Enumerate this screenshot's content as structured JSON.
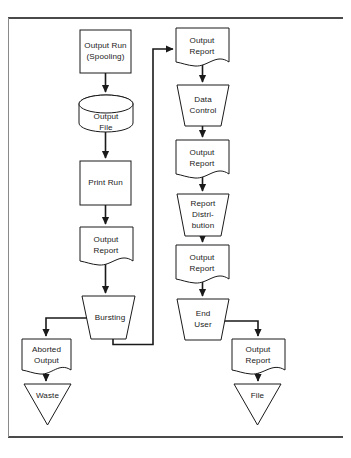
{
  "diagram": {
    "type": "flowchart",
    "colors": {
      "stroke": "#1a1a1a",
      "fill": "#ffffff",
      "frame": "#4a4a4a",
      "background": "#ffffff"
    },
    "nodes": [
      {
        "id": "output-run",
        "label_line1": "Output Run",
        "label_line2": "(Spooling)",
        "shape": "process",
        "x": 80,
        "y": 30,
        "w": 51,
        "h": 43
      },
      {
        "id": "output-file",
        "label_line1": "Output",
        "label_line2": "File",
        "shape": "cylinder",
        "x": 79,
        "y": 95,
        "w": 54,
        "h": 37
      },
      {
        "id": "print-run",
        "label_line1": "Print Run",
        "label_line2": "",
        "shape": "process",
        "x": 80,
        "y": 161,
        "w": 51,
        "h": 44
      },
      {
        "id": "output-report-1",
        "label_line1": "Output",
        "label_line2": "Report",
        "shape": "document",
        "x": 80,
        "y": 227,
        "w": 53,
        "h": 42
      },
      {
        "id": "bursting",
        "label_line1": "Bursting",
        "label_line2": "",
        "shape": "manual",
        "x": 82,
        "y": 296,
        "w": 53,
        "h": 43
      },
      {
        "id": "aborted-output",
        "label_line1": "Aborted",
        "label_line2": "Output",
        "shape": "document",
        "x": 22,
        "y": 339,
        "w": 49,
        "h": 39
      },
      {
        "id": "waste",
        "label_line1": "Waste",
        "label_line2": "",
        "shape": "triangle",
        "x": 24,
        "y": 384,
        "w": 47,
        "h": 41
      },
      {
        "id": "output-report-top",
        "label_line1": "Output",
        "label_line2": "Report",
        "shape": "document",
        "x": 176,
        "y": 28,
        "w": 53,
        "h": 42
      },
      {
        "id": "data-control",
        "label_line1": "Data",
        "label_line2": "Control",
        "shape": "manual",
        "x": 177,
        "y": 85,
        "w": 52,
        "h": 41
      },
      {
        "id": "output-report-2",
        "label_line1": "Output",
        "label_line2": "Report",
        "shape": "document",
        "x": 176,
        "y": 140,
        "w": 53,
        "h": 42
      },
      {
        "id": "report-distribution",
        "label_line1": "Report",
        "label_line2": "Distri-",
        "label_line3": "bution",
        "shape": "manual",
        "x": 177,
        "y": 194,
        "w": 52,
        "h": 42
      },
      {
        "id": "output-report-3",
        "label_line1": "Output",
        "label_line2": "Report",
        "shape": "document",
        "x": 176,
        "y": 245,
        "w": 53,
        "h": 42
      },
      {
        "id": "end-user",
        "label_line1": "End",
        "label_line2": "User",
        "shape": "manual",
        "x": 177,
        "y": 299,
        "w": 52,
        "h": 41
      },
      {
        "id": "output-report-4",
        "label_line1": "Output",
        "label_line2": "Report",
        "shape": "document",
        "x": 232,
        "y": 339,
        "w": 53,
        "h": 42
      },
      {
        "id": "file",
        "label_line1": "File",
        "label_line2": "",
        "shape": "triangle",
        "x": 234,
        "y": 384,
        "w": 47,
        "h": 41
      }
    ],
    "edges": [
      {
        "from": "output-run",
        "to": "output-file",
        "kind": "straight-down"
      },
      {
        "from": "output-file",
        "to": "print-run",
        "kind": "straight-down"
      },
      {
        "from": "print-run",
        "to": "output-report-1",
        "kind": "straight-down"
      },
      {
        "from": "output-report-1",
        "to": "bursting",
        "kind": "straight-down"
      },
      {
        "from": "bursting",
        "to": "aborted-output",
        "kind": "elbow-left"
      },
      {
        "from": "aborted-output",
        "to": "waste",
        "kind": "straight-down"
      },
      {
        "from": "bursting",
        "to": "output-report-top",
        "kind": "feedback-up-right"
      },
      {
        "from": "output-report-top",
        "to": "data-control",
        "kind": "straight-down"
      },
      {
        "from": "data-control",
        "to": "output-report-2",
        "kind": "straight-down"
      },
      {
        "from": "output-report-2",
        "to": "report-distribution",
        "kind": "straight-down"
      },
      {
        "from": "report-distribution",
        "to": "output-report-3",
        "kind": "straight-down"
      },
      {
        "from": "output-report-3",
        "to": "end-user",
        "kind": "straight-down"
      },
      {
        "from": "end-user",
        "to": "output-report-4",
        "kind": "elbow-right"
      },
      {
        "from": "output-report-4",
        "to": "file",
        "kind": "straight-down"
      }
    ],
    "frame": {
      "top_rule_y": 18,
      "bottom_rule_y": 437,
      "left_edge_x": 8
    }
  }
}
